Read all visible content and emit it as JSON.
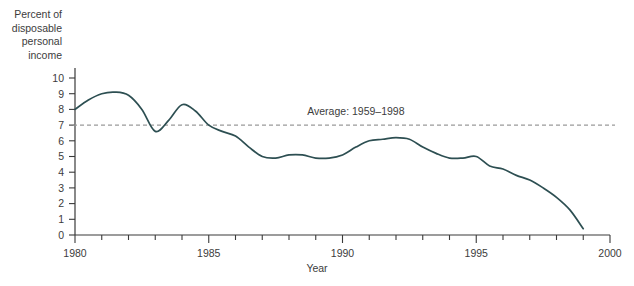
{
  "chart_data": {
    "type": "line",
    "title": "",
    "xlabel": "Year",
    "ylabel": "Percent of disposable personal income",
    "ylabel_lines": [
      "Percent of",
      "disposable",
      "personal",
      "income"
    ],
    "xlim": [
      1980,
      2000
    ],
    "ylim": [
      0,
      10
    ],
    "grid": false,
    "legend": "none",
    "x_ticks": [
      1980,
      1985,
      1990,
      1995,
      2000
    ],
    "x_tick_labels": [
      "1980",
      "1985",
      "1990",
      "1995",
      "2000"
    ],
    "x_minor_tick_interval": 1,
    "y_ticks": [
      0,
      1,
      2,
      3,
      4,
      5,
      6,
      7,
      8,
      9,
      10
    ],
    "y_tick_labels": [
      "0",
      "1",
      "2",
      "3",
      "4",
      "5",
      "6",
      "7",
      "8",
      "9",
      "10"
    ],
    "series": [
      {
        "name": "Personal saving rate",
        "color": "#2d4f52",
        "x": [
          1980.0,
          1980.5,
          1981.0,
          1981.5,
          1982.0,
          1982.5,
          1983.0,
          1983.5,
          1984.0,
          1984.5,
          1985.0,
          1985.5,
          1986.0,
          1986.5,
          1987.0,
          1987.5,
          1988.0,
          1988.5,
          1989.0,
          1989.5,
          1990.0,
          1990.5,
          1991.0,
          1991.5,
          1992.0,
          1992.5,
          1993.0,
          1993.5,
          1994.0,
          1994.5,
          1995.0,
          1995.5,
          1996.0,
          1996.5,
          1997.0,
          1997.5,
          1998.0,
          1998.5,
          1999.0
        ],
        "values": [
          8.0,
          8.6,
          9.0,
          9.1,
          8.9,
          8.0,
          6.6,
          7.3,
          8.3,
          7.9,
          7.0,
          6.6,
          6.3,
          5.6,
          5.0,
          4.9,
          5.1,
          5.1,
          4.9,
          4.9,
          5.1,
          5.6,
          6.0,
          6.1,
          6.2,
          6.1,
          5.6,
          5.2,
          4.9,
          4.9,
          5.0,
          4.4,
          4.2,
          3.8,
          3.5,
          3.0,
          2.4,
          1.6,
          0.4
        ]
      }
    ],
    "reference_line": {
      "label": "Average: 1959–1998",
      "value": 7.0,
      "style": "dashed",
      "color": "#9a9a9a",
      "label_x": 1990.5,
      "label_y": 7.65
    }
  }
}
